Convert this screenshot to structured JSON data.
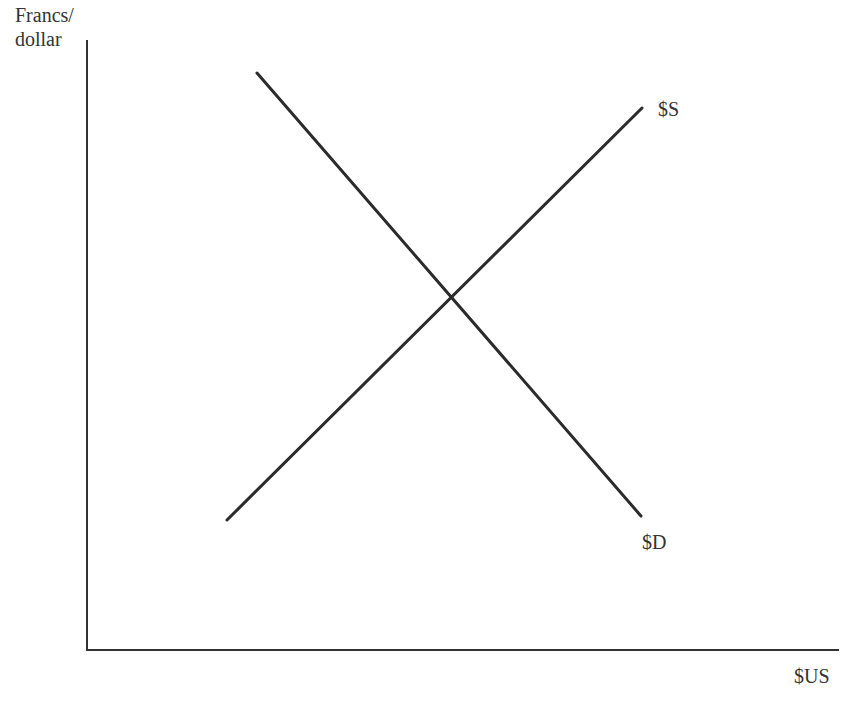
{
  "chart_data": {
    "type": "line",
    "title": "",
    "xlabel": "$US",
    "ylabel": "Francs/ dollar",
    "ylabel_lines": [
      "Francs/",
      "dollar"
    ],
    "grid": false,
    "legend": null,
    "axis_ticks": "none",
    "series": [
      {
        "name": "$S",
        "description": "Supply of dollars (upward sloping)",
        "points": [
          [
            227,
            520
          ],
          [
            642,
            108
          ]
        ],
        "color": "#2b2b2b"
      },
      {
        "name": "$D",
        "description": "Demand for dollars (downward sloping)",
        "points": [
          [
            257,
            73
          ],
          [
            641,
            516
          ]
        ],
        "color": "#2b2b2b"
      }
    ],
    "annotations": [
      {
        "text": "$S",
        "anchor": "end of supply curve, upper right"
      },
      {
        "text": "$D",
        "anchor": "end of demand curve, lower right"
      }
    ],
    "equilibrium_point_px": [
      451,
      297
    ]
  },
  "labels": {
    "y_axis_line1": "Francs/",
    "y_axis_line2": "dollar",
    "x_axis": "$US",
    "supply": "$S",
    "demand": "$D"
  },
  "colors": {
    "axis": "#333333",
    "curve": "#2b2b2b",
    "text": "#333333",
    "background": "#ffffff"
  }
}
